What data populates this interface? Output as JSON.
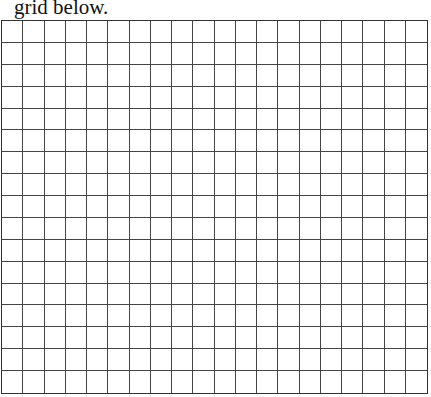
{
  "caption": "grid below.",
  "grid": {
    "columns": 20,
    "rows": 17,
    "line_color": "#333333",
    "background": "#ffffff"
  }
}
